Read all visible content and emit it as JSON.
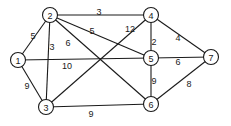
{
  "graph": {
    "nodes": [
      {
        "id": "1",
        "label": "1",
        "x": 18,
        "y": 60
      },
      {
        "id": "2",
        "label": "2",
        "x": 50,
        "y": 15
      },
      {
        "id": "3",
        "label": "3",
        "x": 46,
        "y": 107
      },
      {
        "id": "4",
        "label": "4",
        "x": 151,
        "y": 15
      },
      {
        "id": "5",
        "label": "5",
        "x": 151,
        "y": 58
      },
      {
        "id": "6",
        "label": "6",
        "x": 151,
        "y": 104
      },
      {
        "id": "7",
        "label": "7",
        "x": 211,
        "y": 57
      }
    ],
    "edges": [
      {
        "from": "1",
        "to": "2",
        "weight": "5",
        "lx": 33,
        "ly": 36
      },
      {
        "from": "1",
        "to": "3",
        "weight": "9",
        "lx": 27,
        "ly": 86
      },
      {
        "from": "1",
        "to": "5",
        "weight": "10",
        "lx": 67,
        "ly": 66
      },
      {
        "from": "2",
        "to": "3",
        "weight": "3",
        "lx": 52,
        "ly": 47
      },
      {
        "from": "2",
        "to": "4",
        "weight": "3",
        "lx": 99,
        "ly": 12
      },
      {
        "from": "2",
        "to": "5",
        "weight": "5",
        "lx": 92,
        "ly": 31
      },
      {
        "from": "2",
        "to": "6",
        "weight": "6",
        "lx": 68,
        "ly": 43
      },
      {
        "from": "3",
        "to": "4",
        "weight": "12",
        "lx": 130,
        "ly": 29
      },
      {
        "from": "3",
        "to": "6",
        "weight": "9",
        "lx": 91,
        "ly": 114
      },
      {
        "from": "4",
        "to": "5",
        "weight": "2",
        "lx": 154,
        "ly": 42
      },
      {
        "from": "4",
        "to": "7",
        "weight": "4",
        "lx": 178,
        "ly": 38
      },
      {
        "from": "5",
        "to": "6",
        "weight": "9",
        "lx": 154,
        "ly": 81
      },
      {
        "from": "5",
        "to": "7",
        "weight": "6",
        "lx": 178,
        "ly": 62
      },
      {
        "from": "6",
        "to": "7",
        "weight": "8",
        "lx": 189,
        "ly": 84
      }
    ]
  }
}
